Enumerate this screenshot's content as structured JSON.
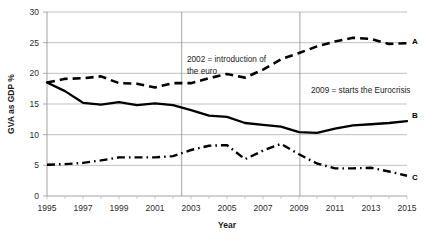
{
  "chart_data": {
    "type": "line",
    "title": "",
    "xlabel": "Year",
    "ylabel": "GVA as GDP %",
    "xlim": [
      1995,
      2015
    ],
    "ylim": [
      0,
      30
    ],
    "ytick_step": 5,
    "yticks": [
      "0",
      "5",
      "10",
      "15",
      "20",
      "25",
      "30"
    ],
    "xticks": [
      "1995",
      "1997",
      "1999",
      "2001",
      "2003",
      "2005",
      "2007",
      "2009",
      "2011",
      "2013",
      "2015"
    ],
    "x": [
      1995,
      1996,
      1997,
      1998,
      1999,
      2000,
      2001,
      2002,
      2003,
      2004,
      2005,
      2006,
      2007,
      2008,
      2009,
      2010,
      2011,
      2012,
      2013,
      2014,
      2015
    ],
    "grid": "horizontal",
    "legend_position": "right-inline",
    "series": [
      {
        "name": "A",
        "style": "dashed",
        "color": "#000000",
        "values": [
          18.5,
          19.1,
          19.2,
          19.5,
          18.4,
          18.3,
          17.7,
          18.4,
          18.4,
          19.2,
          19.9,
          19.3,
          20.6,
          22.3,
          23.3,
          24.4,
          25.2,
          25.8,
          25.6,
          24.8,
          24.9
        ]
      },
      {
        "name": "B",
        "style": "solid",
        "color": "#000000",
        "values": [
          18.5,
          17.1,
          15.2,
          14.9,
          15.3,
          14.8,
          15.1,
          14.8,
          14.0,
          13.1,
          12.9,
          11.9,
          11.6,
          11.3,
          10.4,
          10.3,
          11.0,
          11.5,
          11.7,
          11.9,
          12.2
        ]
      },
      {
        "name": "C",
        "style": "dash-dot",
        "color": "#000000",
        "values": [
          5.1,
          5.2,
          5.4,
          5.8,
          6.3,
          6.3,
          6.3,
          6.5,
          7.5,
          8.2,
          8.3,
          6.0,
          7.4,
          8.5,
          6.8,
          5.3,
          4.5,
          4.5,
          4.6,
          4.0,
          3.3
        ]
      }
    ],
    "series_c_tail": [
      2009,
      2010,
      2011,
      2012,
      2013,
      2014,
      2015
    ],
    "annotations": [
      {
        "name": "euro-introduction",
        "text_line1": "2002 = introduction of",
        "text_line2": "the euro",
        "marker_year": 2002
      },
      {
        "name": "eurocrisis-start",
        "text_line1": "2009 = starts the Eurocrisis",
        "text_line2": "",
        "marker_year": 2009
      }
    ],
    "vertical_markers": [
      2002,
      2009
    ]
  }
}
